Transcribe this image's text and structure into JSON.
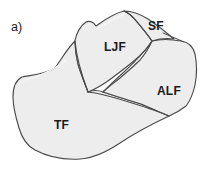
{
  "figure": {
    "panel_letter": "a)",
    "background_color": "#ffffff",
    "outline_color": "#4a4a4a",
    "fill_color": "#ededed",
    "label_color": "#1a1a1a",
    "regions": [
      {
        "id": "sf",
        "label": "SF",
        "name": "superior-facet"
      },
      {
        "id": "ljf",
        "label": "LJF",
        "name": "lateral-joint-facet"
      },
      {
        "id": "alf",
        "label": "ALF",
        "name": "anterolateral-facet"
      },
      {
        "id": "tf",
        "label": "TF",
        "name": "transverse-facet"
      }
    ]
  }
}
